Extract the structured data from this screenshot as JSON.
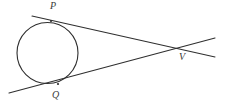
{
  "figure": {
    "background_color": "#ffffff",
    "stroke_color": "#2f2f2f",
    "label_color": "#3a3a3a",
    "stroke_width": 1.1
  },
  "labels": {
    "p": "P",
    "q": "Q",
    "v": "V"
  },
  "chart_data": {
    "type": "diagram",
    "circle": {
      "name": "circle",
      "center_x": 47.5,
      "center_y": 53,
      "radius": 30.5
    },
    "points": [
      {
        "name": "P",
        "label": "P",
        "x": 51,
        "y": 21,
        "label_x": 54,
        "label_y": 6,
        "role": "tangent-point-upper"
      },
      {
        "name": "Q",
        "label": "Q",
        "x": 58,
        "y": 84,
        "label_x": 56,
        "label_y": 95,
        "role": "tangent-point-lower"
      },
      {
        "name": "V",
        "label": "V",
        "x": 182,
        "y": 50,
        "label_x": 183,
        "label_y": 57,
        "role": "external-intersection"
      }
    ],
    "segments": [
      {
        "name": "tangent-PV",
        "x1": 32,
        "y1": 16,
        "x2": 215,
        "y2": 57,
        "through": [
          "P",
          "V"
        ]
      },
      {
        "name": "tangent-QV",
        "x1": 9,
        "y1": 93,
        "x2": 215,
        "y2": 38,
        "through": [
          "Q",
          "V"
        ]
      }
    ]
  }
}
